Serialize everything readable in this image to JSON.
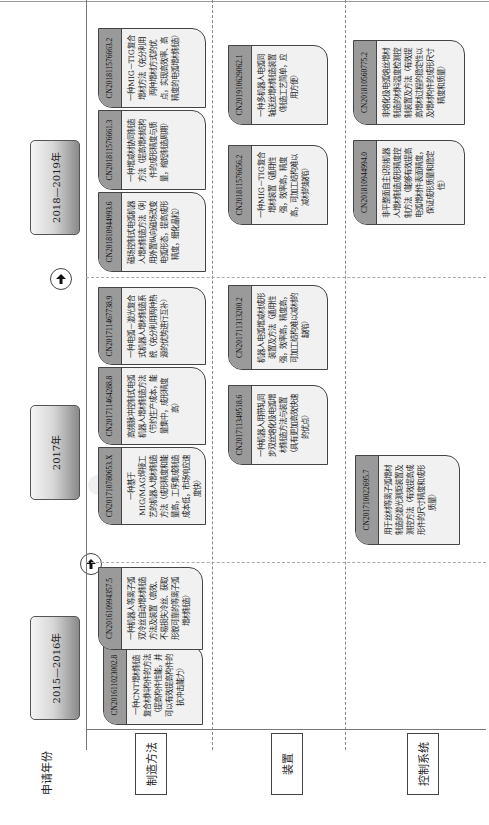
{
  "row_header": "申请年份",
  "periods": [
    {
      "label": "2015—2016年"
    },
    {
      "label": "2017年"
    },
    {
      "label": "2018—2019年"
    }
  ],
  "rows": [
    {
      "label": "制造方法"
    },
    {
      "label": "装置"
    },
    {
      "label": "控制系统"
    }
  ],
  "icons": {
    "arrow": "arrow-right-icon"
  },
  "cards": {
    "manufacturing": [
      {
        "id": "CN201611023002.8",
        "text": "一种CNT增材制造复合材料构件的方法（提高构件性能，并可以有效提高构件的抗冲击能力）"
      },
      {
        "id": "CN201610994357.5",
        "text": "一种机器人等离子弧双冷丝自动增材制造方法及装置（高效、不易损失冷丝、获取形貌可靠的等离子弧增材制造）"
      },
      {
        "id": "CN201710780653.X",
        "text": "一种基于MIG/MAG焊接工艺的机器人增材制造方法（成形精度和能量高，工序集成制造成本低，市场响应速度快）"
      },
      {
        "id": "CN201711464288.8",
        "text": "高频脉冲控制式电弧机器人增材制造方法（节约生产成本，能量集中，成形精度高）"
      },
      {
        "id": "CN201711467738.9",
        "text": "一种电弧－激光复合式机器人增材制造系统（充分利用两种热源的优势进行互补）"
      },
      {
        "id": "CN201810944993.6",
        "text": "磁场控制式电弧机器人增材制造方法（利用外置纵向磁场改变电弧形态，提高成形精度，细化晶粒）"
      },
      {
        "id": "CN201811576661.3",
        "text": "一种增减材协同制造方法（提高增材结构件的成形精度与质量，缩短制造周期）"
      },
      {
        "id": "CN201811576663.2",
        "text": "一种MIG－TIG复合增材方法（充分利用两种增材方式的优点，实现高效率、高精度的电弧增材制造）"
      }
    ],
    "device": [
      {
        "id": "CN201711349518.6",
        "text": "一种机器人用带轧同步双丝熔化极电弧增材制造方法与装置（具有更加高效快速的优点）"
      },
      {
        "id": "CN201711313200.2",
        "text": "机器人电弧增减材成形装置及方法（通用性强，效率高，精度高，可加工结构难以减材的缺陷）"
      },
      {
        "id": "CN201811576656.2",
        "text": "一种MIG－TIG复合增材装置（通用性强，效率高，精度高，可加工结构难以减材的缺陷）"
      },
      {
        "id": "CN201910629062.1",
        "text": "一种多机器人电弧同轴送丝增材制造装置（制造工艺简单，应用方便）"
      }
    ],
    "control": [
      {
        "id": "CN201710022695.7",
        "text": "用于丝材等离子弧增材制造的激光测距装置及测控方法（有效提高成形件的尺寸精度和成形质量）"
      },
      {
        "id": "CN201810944994.0",
        "text": "非平整面自主识别机器人增材制造成形精度控制方法（能够有效提高电弧增材件表面精度，保证成形质量和稳定性）"
      },
      {
        "id": "CN201810560775.2",
        "text": "非熔化极电弧熔丝增材制造的材料温度检测控制装置及方法（有效提高增材过程的稳定性以及增材构件的成形尺寸精度和质量）"
      }
    ]
  }
}
